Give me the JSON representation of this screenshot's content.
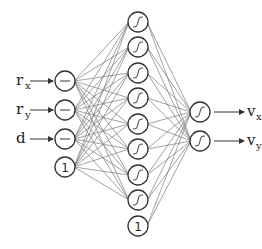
{
  "diagram": {
    "type": "feedforward-neural-network",
    "colors": {
      "node_stroke": "#333333",
      "edge": "#7a7a7a",
      "text": "#222222"
    },
    "input_layer": {
      "x": 65,
      "radius": 10,
      "nodes": [
        {
          "y": 81,
          "kind": "linear",
          "label": "r",
          "sub": "x"
        },
        {
          "y": 110,
          "kind": "linear",
          "label": "r",
          "sub": "y"
        },
        {
          "y": 139,
          "kind": "linear",
          "label": "d",
          "sub": ""
        },
        {
          "y": 167,
          "kind": "bias",
          "text": "1"
        }
      ]
    },
    "hidden_layer": {
      "x": 138,
      "radius": 10,
      "nodes": [
        {
          "y": 22,
          "kind": "sigmoid"
        },
        {
          "y": 47,
          "kind": "sigmoid"
        },
        {
          "y": 73,
          "kind": "sigmoid"
        },
        {
          "y": 98,
          "kind": "sigmoid"
        },
        {
          "y": 124,
          "kind": "sigmoid"
        },
        {
          "y": 149,
          "kind": "sigmoid"
        },
        {
          "y": 175,
          "kind": "sigmoid"
        },
        {
          "y": 200,
          "kind": "sigmoid"
        },
        {
          "y": 226,
          "kind": "bias",
          "text": "1"
        }
      ]
    },
    "output_layer": {
      "x": 200,
      "radius": 10,
      "nodes": [
        {
          "y": 112,
          "kind": "sigmoid",
          "label": "v",
          "sub": "x"
        },
        {
          "y": 141,
          "kind": "sigmoid",
          "label": "v",
          "sub": "y"
        }
      ]
    }
  }
}
